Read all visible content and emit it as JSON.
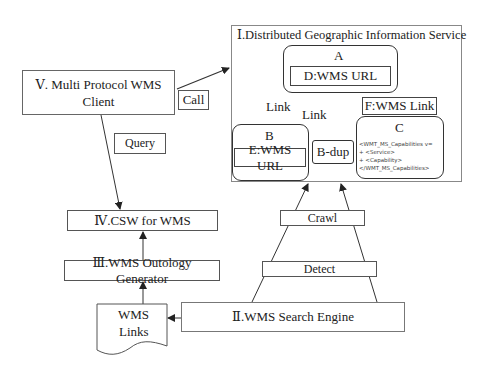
{
  "diagram": {
    "dgis": {
      "title": "Ⅰ.Distributed Geographic Information Service",
      "node_a": {
        "label": "A",
        "inner": "D:WMS URL"
      },
      "node_b": {
        "label": "B",
        "inner": "E:WMS URL"
      },
      "node_bdup": {
        "label": "B-dup"
      },
      "node_c": {
        "label": "C",
        "code_lines": [
          "<WMT_MS_Capabilities v=",
          "+  <Service>",
          "+  <Capability>",
          "</WMT_MS_Capabilities>"
        ]
      },
      "node_f": {
        "label": "F:WMS Link"
      },
      "link_label_1": "Link",
      "link_label_2": "Link"
    },
    "client": {
      "line1": "Ⅴ.  Multi Protocol WMS",
      "line2": "Client"
    },
    "call_label": "Call",
    "query_label": "Query",
    "csw": {
      "label": "Ⅳ.CSW for WMS"
    },
    "ontology": {
      "label": "Ⅲ.WMS Outology Generator"
    },
    "wms_links": {
      "line1": "WMS",
      "line2": "Links"
    },
    "search_engine": {
      "label": "Ⅱ.WMS  Search Engine"
    },
    "crawl_label": "Crawl",
    "detect_label": "Detect"
  }
}
